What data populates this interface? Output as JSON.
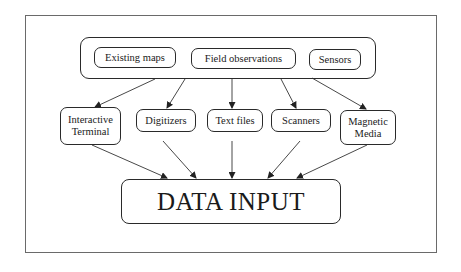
{
  "diagram": {
    "sources": [
      {
        "id": "existing_maps",
        "label": "Existing maps"
      },
      {
        "id": "field_observations",
        "label": "Field observations"
      },
      {
        "id": "sensors",
        "label": "Sensors"
      }
    ],
    "methods": [
      {
        "id": "interactive_terminal",
        "label_line1": "Interactive",
        "label_line2": "Terminal"
      },
      {
        "id": "digitizers",
        "label_line1": "Digitizers"
      },
      {
        "id": "text_files",
        "label_line1": "Text files"
      },
      {
        "id": "scanners",
        "label_line1": "Scanners"
      },
      {
        "id": "magnetic_media",
        "label_line1": "Magnetic",
        "label_line2": "Media"
      }
    ],
    "target": {
      "label": "DATA INPUT"
    },
    "edges": [
      {
        "from": "sources",
        "to": "interactive_terminal"
      },
      {
        "from": "sources",
        "to": "digitizers"
      },
      {
        "from": "sources",
        "to": "text_files"
      },
      {
        "from": "sources",
        "to": "scanners"
      },
      {
        "from": "sources",
        "to": "magnetic_media"
      },
      {
        "from": "interactive_terminal",
        "to": "target"
      },
      {
        "from": "digitizers",
        "to": "target"
      },
      {
        "from": "text_files",
        "to": "target"
      },
      {
        "from": "scanners",
        "to": "target"
      },
      {
        "from": "magnetic_media",
        "to": "target"
      }
    ]
  }
}
